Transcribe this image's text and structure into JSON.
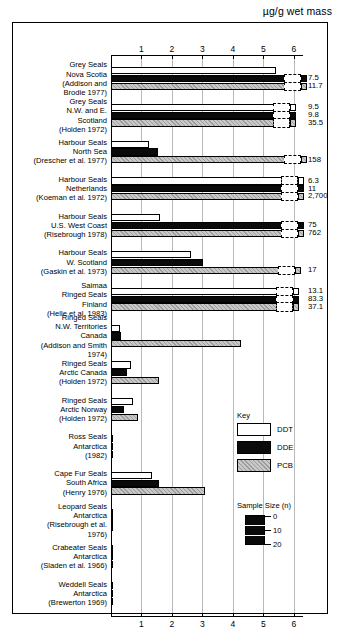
{
  "chart_data": {
    "type": "bar",
    "title": "",
    "xlabel": "µg/g wet mass",
    "ylabel": "",
    "xlim": [
      0,
      6.3
    ],
    "grid": true,
    "orientation": "horizontal",
    "axis_title": "µg/g wet mass",
    "tick_labels": [
      "1",
      "2",
      "3",
      "4",
      "5",
      "6"
    ],
    "tick_values": [
      1,
      2,
      3,
      4,
      5,
      6
    ],
    "legend_position": "inside-right",
    "legend": {
      "title": "Key",
      "entries": [
        {
          "label": "DDT",
          "fill": "white"
        },
        {
          "label": "DDE",
          "fill": "black"
        },
        {
          "label": "PCB",
          "fill": "grey-hatched"
        }
      ]
    },
    "size_legend": {
      "title": "Sample Size (n)",
      "ticks": [
        "0",
        "10",
        "20"
      ]
    },
    "series": [
      {
        "name": "DDT",
        "color": "#ffffff"
      },
      {
        "name": "DDE",
        "color": "#0a0a0a"
      },
      {
        "name": "PCB",
        "color": "#c8c8c8"
      }
    ],
    "categories": [
      {
        "label": "Grey Seals\nNova Scotia\n(Addison and\nBrodie 1977)",
        "bars": [
          {
            "series": "DDT",
            "plotted": 5.4,
            "broken": false,
            "value_label": ""
          },
          {
            "series": "DDE",
            "plotted": 5.72,
            "broken": true,
            "value_label": "7.5"
          },
          {
            "series": "PCB",
            "plotted": 5.72,
            "broken": true,
            "value_label": "11.7"
          }
        ]
      },
      {
        "label": "Grey Seals\nN.W. and E.\nScotland\n(Holden 1972)",
        "bars": [
          {
            "series": "DDT",
            "plotted": 5.35,
            "broken": true,
            "value_label": "9.5"
          },
          {
            "series": "DDE",
            "plotted": 5.35,
            "broken": true,
            "value_label": "9.8"
          },
          {
            "series": "PCB",
            "plotted": 5.35,
            "broken": true,
            "value_label": "35.5"
          }
        ]
      },
      {
        "label": "Harbour Seals\nNorth Sea\n(Drescher et al. 1977)",
        "bars": [
          {
            "series": "DDT",
            "plotted": 1.25,
            "broken": false,
            "value_label": ""
          },
          {
            "series": "DDE",
            "plotted": 1.55,
            "broken": false,
            "value_label": ""
          },
          {
            "series": "PCB",
            "plotted": 5.72,
            "broken": true,
            "value_label": "158"
          }
        ]
      },
      {
        "label": "Harbour Seals\nNetherlands\n(Koeman et al. 1972)",
        "bars": [
          {
            "series": "DDT",
            "plotted": 5.6,
            "broken": true,
            "value_label": "6.3"
          },
          {
            "series": "DDE",
            "plotted": 5.6,
            "broken": true,
            "value_label": "11"
          },
          {
            "series": "PCB",
            "plotted": 5.6,
            "broken": true,
            "value_label": "2,700"
          }
        ]
      },
      {
        "label": "Harbour Seals\nU.S. West Coast\n(Risebrough 1978)",
        "bars": [
          {
            "series": "DDT",
            "plotted": 1.6,
            "broken": false,
            "value_label": ""
          },
          {
            "series": "DDE",
            "plotted": 5.6,
            "broken": true,
            "value_label": "75"
          },
          {
            "series": "PCB",
            "plotted": 5.6,
            "broken": true,
            "value_label": "762"
          }
        ]
      },
      {
        "label": "Harbour Seals\nW. Scotland\n(Gaskin et al. 1973)",
        "bars": [
          {
            "series": "DDT",
            "plotted": 2.62,
            "broken": false,
            "value_label": ""
          },
          {
            "series": "DDE",
            "plotted": 3.02,
            "broken": false,
            "value_label": ""
          },
          {
            "series": "PCB",
            "plotted": 5.5,
            "broken": true,
            "value_label": "17"
          }
        ]
      },
      {
        "label": "Saimaa\nRinged Seals\nFinland\n(Helle et al. 1983)",
        "bars": [
          {
            "series": "DDT",
            "plotted": 5.45,
            "broken": true,
            "value_label": "13.1"
          },
          {
            "series": "DDE",
            "plotted": 5.45,
            "broken": true,
            "value_label": "83.3"
          },
          {
            "series": "PCB",
            "plotted": 5.45,
            "broken": true,
            "value_label": "37.1"
          }
        ]
      },
      {
        "label": "Ringed Seals\nN.W. Territories\nCanada\n(Addison and Smith\n1974)",
        "bars": [
          {
            "series": "DDT",
            "plotted": 0.28,
            "broken": false,
            "value_label": ""
          },
          {
            "series": "DDE",
            "plotted": 0.34,
            "broken": false,
            "value_label": ""
          },
          {
            "series": "PCB",
            "plotted": 4.28,
            "broken": false,
            "value_label": ""
          }
        ]
      },
      {
        "label": "Ringed Seals\nArctic Canada\n(Holden 1972)",
        "bars": [
          {
            "series": "DDT",
            "plotted": 0.66,
            "broken": false,
            "value_label": ""
          },
          {
            "series": "DDE",
            "plotted": 0.52,
            "broken": false,
            "value_label": ""
          },
          {
            "series": "PCB",
            "plotted": 1.58,
            "broken": false,
            "value_label": ""
          }
        ]
      },
      {
        "label": "Ringed Seals\nArctic Norway\n(Holden 1972)",
        "bars": [
          {
            "series": "DDT",
            "plotted": 0.72,
            "broken": false,
            "value_label": ""
          },
          {
            "series": "DDE",
            "plotted": 0.44,
            "broken": false,
            "value_label": ""
          },
          {
            "series": "PCB",
            "plotted": 0.9,
            "broken": false,
            "value_label": ""
          }
        ]
      },
      {
        "label": "Ross Seals\nAntarctica\n(1982)",
        "bars": [
          {
            "series": "DDT",
            "plotted": 0.05,
            "broken": false,
            "value_label": ""
          },
          {
            "series": "DDE",
            "plotted": 0.05,
            "broken": false,
            "value_label": ""
          },
          {
            "series": "PCB",
            "plotted": 0.05,
            "broken": false,
            "value_label": ""
          }
        ]
      },
      {
        "label": "Cape Fur Seals\nSouth Africa\n(Henry 1976)",
        "bars": [
          {
            "series": "DDT",
            "plotted": 1.34,
            "broken": false,
            "value_label": ""
          },
          {
            "series": "DDE",
            "plotted": 1.58,
            "broken": false,
            "value_label": ""
          },
          {
            "series": "PCB",
            "plotted": 3.08,
            "broken": false,
            "value_label": ""
          }
        ]
      },
      {
        "label": "Leopard Seals\nAntarctica\n(Risebrough et al.\n1976)",
        "bars": [
          {
            "series": "DDT",
            "plotted": 0.05,
            "broken": false,
            "value_label": ""
          },
          {
            "series": "DDE",
            "plotted": 0.06,
            "broken": false,
            "value_label": ""
          },
          {
            "series": "PCB",
            "plotted": 0.04,
            "broken": false,
            "value_label": ""
          }
        ]
      },
      {
        "label": "Crabeater Seals\nAntarctica\n(Sladen et al. 1966)",
        "bars": [
          {
            "series": "DDT",
            "plotted": 0.05,
            "broken": false,
            "value_label": ""
          },
          {
            "series": "DDE",
            "plotted": 0.05,
            "broken": false,
            "value_label": ""
          },
          {
            "series": "PCB",
            "plotted": 0.0,
            "broken": false,
            "value_label": ""
          }
        ]
      },
      {
        "label": "Weddell Seals\nAntarctica\n(Brewerton 1969)",
        "bars": [
          {
            "series": "DDT",
            "plotted": 0.05,
            "broken": false,
            "value_label": ""
          },
          {
            "series": "DDE",
            "plotted": 0.04,
            "broken": false,
            "value_label": ""
          },
          {
            "series": "PCB",
            "plotted": 0.0,
            "broken": false,
            "value_label": ""
          }
        ]
      }
    ]
  }
}
